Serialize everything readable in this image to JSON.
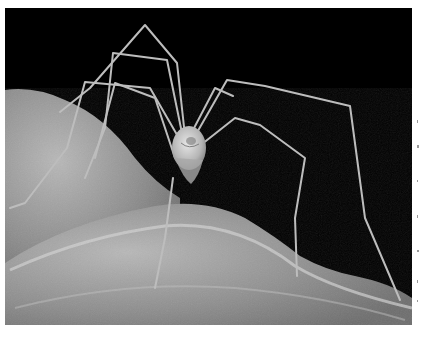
{
  "image": {
    "subject": "harvestman spider (daddy longlegs) standing on a leaf",
    "alt": "Close-up photo of a long-legged harvestman on a textured grey leaf against a black background",
    "caption": "",
    "colors": {
      "background": "#000000",
      "leaf": "#9a9a9a",
      "leaf_highlight": "#c8c8c8",
      "leg": "#bdbdbd",
      "body": "#d0d0d0",
      "page": "#ffffff"
    }
  }
}
